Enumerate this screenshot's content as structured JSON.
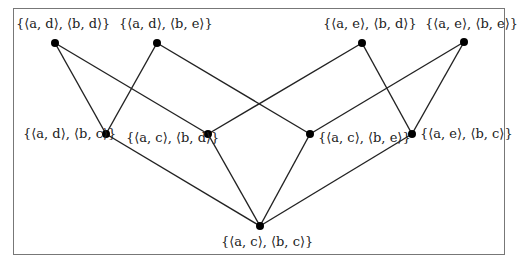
{
  "diagram": {
    "type": "lattice",
    "edge_color": "#222222",
    "node_color": "#000000",
    "frame_color": "#777777",
    "nodes": [
      {
        "id": "ad_bd",
        "label": "{⟨a, d⟩, ⟨b, d⟩}",
        "x": 55,
        "y": 43,
        "label_x": 16,
        "label_y": 16
      },
      {
        "id": "ad_be",
        "label": "{⟨a, d⟩, ⟨b, e⟩}",
        "x": 157,
        "y": 43,
        "label_x": 119,
        "label_y": 16
      },
      {
        "id": "ae_bd",
        "label": "{⟨a, e⟩, ⟨b, d⟩}",
        "x": 362,
        "y": 43,
        "label_x": 323,
        "label_y": 16
      },
      {
        "id": "ae_be",
        "label": "{⟨a, e⟩, ⟨b, e⟩}",
        "x": 464,
        "y": 42,
        "label_x": 425,
        "label_y": 16
      },
      {
        "id": "ad_bc",
        "label": "{⟨a, d⟩, ⟨b, c⟩}",
        "x": 106,
        "y": 134,
        "label_x": 23,
        "label_y": 126
      },
      {
        "id": "ac_bd",
        "label": "{⟨a, c⟩, ⟨b, d⟩}",
        "x": 208,
        "y": 134,
        "label_x": 126,
        "label_y": 130
      },
      {
        "id": "ac_be",
        "label": "{⟨a, c⟩, ⟨b, e⟩}",
        "x": 310,
        "y": 134,
        "label_x": 318,
        "label_y": 130
      },
      {
        "id": "ae_bc",
        "label": "{⟨a, e⟩, ⟨b, c⟩}",
        "x": 412,
        "y": 134,
        "label_x": 420,
        "label_y": 126
      },
      {
        "id": "ac_bc",
        "label": "{⟨a, c⟩, ⟨b, c⟩}",
        "x": 260,
        "y": 226,
        "label_x": 221,
        "label_y": 234
      }
    ],
    "edges": [
      [
        "ad_bd",
        "ad_bc"
      ],
      [
        "ad_bd",
        "ac_bd"
      ],
      [
        "ad_be",
        "ad_bc"
      ],
      [
        "ad_be",
        "ac_be"
      ],
      [
        "ae_bd",
        "ac_bd"
      ],
      [
        "ae_bd",
        "ae_bc"
      ],
      [
        "ae_be",
        "ac_be"
      ],
      [
        "ae_be",
        "ae_bc"
      ],
      [
        "ad_bc",
        "ac_bc"
      ],
      [
        "ac_bd",
        "ac_bc"
      ],
      [
        "ac_be",
        "ac_bc"
      ],
      [
        "ae_bc",
        "ac_bc"
      ]
    ]
  }
}
